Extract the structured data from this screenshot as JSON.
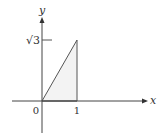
{
  "diagram": {
    "type": "coordinate-plot",
    "axes": {
      "x_label": "x",
      "y_label": "y",
      "origin_label": "0"
    },
    "ticks": {
      "x": [
        {
          "value": 1,
          "label": "1"
        }
      ],
      "y": [
        {
          "value": 1.732,
          "label": "√3"
        }
      ]
    },
    "shape": {
      "type": "triangle",
      "vertices": [
        [
          0,
          0
        ],
        [
          1,
          0
        ],
        [
          1,
          1.732
        ]
      ],
      "fill": "#f3f3f3",
      "stroke": "#444444"
    }
  }
}
